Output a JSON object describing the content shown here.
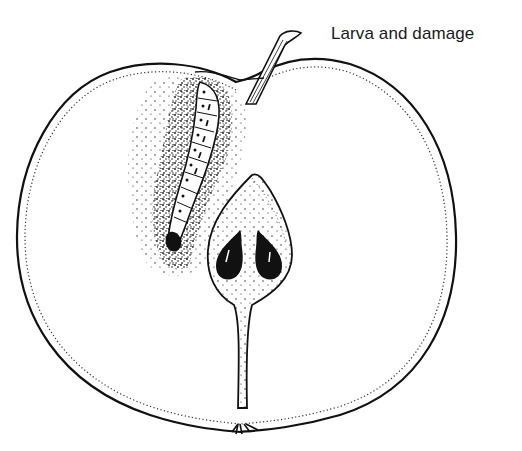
{
  "figure": {
    "caption": "Larva and damage",
    "elements": {
      "fruit": "apple-half-outline",
      "stem": "stalk",
      "larva": "codling-moth-larva",
      "damage": "frass-stippled-tunnel",
      "core": "seed-chamber",
      "seeds": 2,
      "calyx": "calyx-end"
    },
    "colors": {
      "ink": "#111111",
      "paper": "#ffffff"
    }
  }
}
